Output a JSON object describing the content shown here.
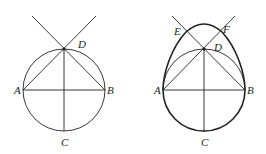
{
  "figures": [
    {
      "name": "circle-construction",
      "labels": {
        "A": "A",
        "B": "B",
        "C": "C",
        "D": "D"
      }
    },
    {
      "name": "egg-construction",
      "labels": {
        "A": "A",
        "B": "B",
        "C": "C",
        "D": "D",
        "E": "E",
        "F": "F"
      }
    }
  ],
  "colors": {
    "stroke": "#222222",
    "background": "#ffffff"
  }
}
